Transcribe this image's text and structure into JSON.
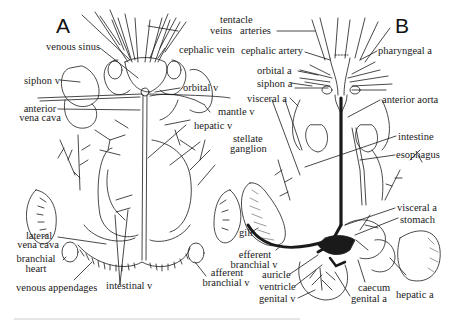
{
  "figure": {
    "panel_a": "A",
    "panel_b": "B",
    "panel_a_labels": {
      "tentacle": "tentacle",
      "veins": "veins",
      "venous_sinus": "venous sinus",
      "cephalic_vein": "cephalic vein",
      "siphon_v": "siphon v",
      "orbital_v": "orbital v",
      "anterior_vena_cava_1": "anterior",
      "anterior_vena_cava_2": "vena cava",
      "mantle_v": "mantle v",
      "hepatic_v": "hepatic v",
      "stellate_ganglion_1": "stellate",
      "stellate_ganglion_2": "ganglion",
      "lateral_vena_cava_1": "lateral",
      "lateral_vena_cava_2": "vena cava",
      "branchial_heart_1": "branchial",
      "branchial_heart_2": "heart",
      "venous_appendages": "venous appendages",
      "intestinal_v": "intestinal v",
      "afferent_branchial_v_1": "afferent",
      "afferent_branchial_v_2": "branchial v"
    },
    "panel_b_labels": {
      "arteries": "arteries",
      "cephalic_artery": "cephalic artery",
      "pharyngeal_a": "pharyngeal a",
      "orbital_a": "orbital a",
      "siphon_a": "siphon a",
      "visceral_a_top": "visceral a",
      "anterior_aorta": "anterior aorta",
      "intestine": "intestine",
      "esophagus": "esophagus",
      "gill": "gill",
      "visceral_a": "visceral a",
      "stomach": "stomach",
      "efferent_branchial_v_1": "efferent",
      "efferent_branchial_v_2": "branchial v",
      "auricle": "auricle",
      "ventricle": "ventricle",
      "genital_v": "genital v",
      "caecum": "caecum",
      "genital_a": "genital a",
      "hepatic_a": "hepatic a"
    }
  },
  "colors": {
    "ink": "#1a1a1a",
    "background": "#ffffff",
    "stipple": "#555555"
  }
}
